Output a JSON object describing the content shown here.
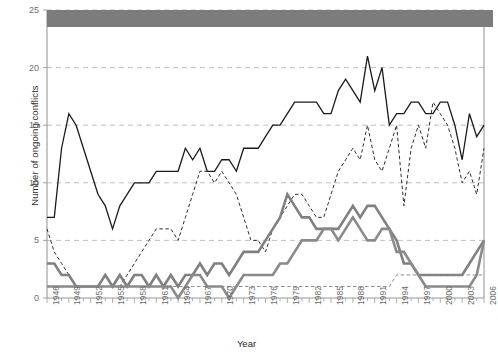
{
  "figure": {
    "axis_color": "#9a9a9a",
    "grid_color": "#b9b9b9",
    "tick_label_color": "#6d6d6d",
    "title_color": "#2b2b2b",
    "background": "#ffffff",
    "redaction_color": "#7c7c7c"
  },
  "chart_data": {
    "type": "line",
    "title": "",
    "xlabel": "Year",
    "ylabel": "Number of ongoing conflicts",
    "xlim": [
      1946,
      2006
    ],
    "ylim": [
      0,
      25
    ],
    "yticks": [
      0,
      5,
      10,
      15,
      20,
      25
    ],
    "xticks": [
      1946,
      1949,
      1952,
      1955,
      1958,
      1961,
      1964,
      1967,
      1970,
      1973,
      1976,
      1979,
      1982,
      1985,
      1988,
      1991,
      1994,
      1997,
      2000,
      2003,
      2006
    ],
    "minor_xticks_every": 1,
    "grid": "horizontal-dashed",
    "legend": "obscured",
    "x": [
      1946,
      1947,
      1948,
      1949,
      1950,
      1951,
      1952,
      1953,
      1954,
      1955,
      1956,
      1957,
      1958,
      1959,
      1960,
      1961,
      1962,
      1963,
      1964,
      1965,
      1966,
      1967,
      1968,
      1969,
      1970,
      1971,
      1972,
      1973,
      1974,
      1975,
      1976,
      1977,
      1978,
      1979,
      1980,
      1981,
      1982,
      1983,
      1984,
      1985,
      1986,
      1987,
      1988,
      1989,
      1990,
      1991,
      1992,
      1993,
      1994,
      1995,
      1996,
      1997,
      1998,
      1999,
      2000,
      2001,
      2002,
      2003,
      2004,
      2005,
      2006
    ],
    "series": [
      {
        "name": "series-black-solid",
        "style": "solid",
        "color": "#1a1a1a",
        "width": 1.3,
        "values": [
          7,
          7,
          13,
          16,
          15,
          13,
          11,
          9,
          8,
          6,
          8,
          9,
          10,
          10,
          10,
          11,
          11,
          11,
          11,
          13,
          12,
          13,
          11,
          11,
          12,
          12,
          11,
          13,
          13,
          13,
          14,
          15,
          15,
          16,
          17,
          17,
          17,
          17,
          16,
          16,
          18,
          19,
          18,
          17,
          21,
          18,
          20,
          15,
          16,
          16,
          17,
          17,
          16,
          16,
          17,
          17,
          15,
          12,
          16,
          14,
          15
        ]
      },
      {
        "name": "series-black-dashed",
        "style": "dashed",
        "color": "#2e2e2e",
        "width": 1.0,
        "values": [
          6,
          4,
          3,
          2,
          1,
          1,
          1,
          1,
          1,
          1,
          1,
          2,
          3,
          4,
          5,
          6,
          6,
          6,
          5,
          7,
          9,
          11,
          11,
          10,
          11,
          10,
          9,
          7,
          5,
          5,
          4,
          6,
          7,
          8,
          9,
          9,
          8,
          7,
          7,
          9,
          11,
          12,
          13,
          12,
          15,
          12,
          11,
          13,
          15,
          8,
          13,
          15,
          13,
          17,
          16,
          15,
          13,
          10,
          11,
          9,
          13
        ]
      },
      {
        "name": "series-gray-solid-upper",
        "style": "solid",
        "color": "#808080",
        "width": 2.6,
        "values": [
          3,
          3,
          2,
          2,
          1,
          1,
          1,
          1,
          2,
          1,
          2,
          1,
          2,
          2,
          1,
          2,
          1,
          2,
          1,
          2,
          2,
          3,
          2,
          3,
          3,
          2,
          3,
          4,
          4,
          4,
          5,
          6,
          7,
          9,
          8,
          7,
          7,
          6,
          6,
          6,
          6,
          7,
          8,
          7,
          8,
          8,
          7,
          6,
          5,
          3,
          3,
          2,
          2,
          2,
          2,
          2,
          2,
          2,
          3,
          4,
          5
        ]
      },
      {
        "name": "series-gray-solid-lower",
        "style": "solid",
        "color": "#8a8a8a",
        "width": 2.6,
        "values": [
          1,
          1,
          1,
          1,
          1,
          1,
          1,
          1,
          1,
          1,
          1,
          1,
          1,
          1,
          1,
          1,
          1,
          1,
          0,
          1,
          2,
          2,
          1,
          1,
          1,
          0,
          1,
          2,
          2,
          2,
          2,
          2,
          3,
          3,
          4,
          5,
          5,
          5,
          6,
          6,
          5,
          6,
          7,
          6,
          5,
          5,
          6,
          6,
          4,
          4,
          3,
          2,
          1,
          1,
          1,
          1,
          1,
          1,
          1,
          2,
          5
        ]
      },
      {
        "name": "series-gray-dashed",
        "style": "dashed",
        "color": "#8a8a8a",
        "width": 1.0,
        "values": [
          1,
          1,
          1,
          1,
          1,
          1,
          1,
          1,
          1,
          1,
          1,
          1,
          1,
          1,
          1,
          1,
          1,
          1,
          1,
          1,
          1,
          1,
          1,
          1,
          1,
          1,
          1,
          1,
          1,
          1,
          1,
          1,
          1,
          1,
          1,
          1,
          1,
          1,
          1,
          1,
          1,
          1,
          1,
          1,
          1,
          1,
          1,
          1,
          2,
          2,
          2,
          2,
          2,
          2,
          2,
          2,
          2,
          2,
          2,
          2,
          2
        ]
      }
    ]
  },
  "redaction": {
    "label": "obscured-legend-band"
  }
}
